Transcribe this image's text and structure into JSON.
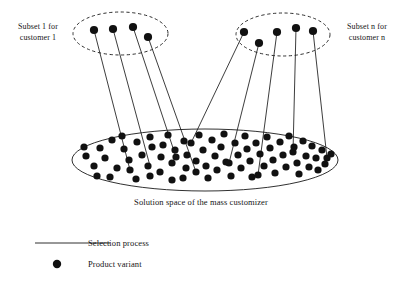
{
  "figure": {
    "title_not_shown": "",
    "labels": {
      "subset_1": "Subset 1 for\ncustomer 1",
      "subset_1_line1": "Subset 1 for",
      "subset_1_line2": "customer 1",
      "subset_n_line1": "Subset n for",
      "subset_n_line2": "customer n",
      "solution_space_caption": "Solution space of the mass customizer"
    },
    "legend": {
      "line_item_label": "Selection process",
      "dot_item_label": "Product variant"
    },
    "colors": {
      "stroke": "#1a1a1a",
      "dot_fill": "#111111",
      "background": "#ffffff"
    }
  },
  "chart_data": {
    "type": "diagram",
    "shapes": {
      "subset_left_ellipse": {
        "cx": 120.5,
        "cy": 33.5,
        "rx": 47.5,
        "ry": 21.5,
        "dashed": true
      },
      "subset_right_ellipse": {
        "cx": 283.0,
        "cy": 34.5,
        "rx": 47.0,
        "ry": 21.5,
        "dashed": true
      },
      "solution_space_ellipse": {
        "cx": 205.0,
        "cy": 160.0,
        "rx": 133.0,
        "ry": 31.0,
        "dashed": false
      }
    },
    "subset_left_dots": [
      {
        "x": 94,
        "y": 30
      },
      {
        "x": 113,
        "y": 29
      },
      {
        "x": 133,
        "y": 27
      },
      {
        "x": 148,
        "y": 37
      }
    ],
    "subset_right_dots": [
      {
        "x": 244,
        "y": 32
      },
      {
        "x": 259,
        "y": 43
      },
      {
        "x": 277,
        "y": 32
      },
      {
        "x": 296,
        "y": 28
      },
      {
        "x": 313,
        "y": 31
      }
    ],
    "selection_lines": [
      {
        "x1": 94,
        "y1": 30,
        "x2": 130,
        "y2": 170
      },
      {
        "x1": 113,
        "y1": 29,
        "x2": 150,
        "y2": 166
      },
      {
        "x1": 133,
        "y1": 27,
        "x2": 176,
        "y2": 157
      },
      {
        "x1": 148,
        "y1": 37,
        "x2": 196,
        "y2": 172
      },
      {
        "x1": 244,
        "y1": 32,
        "x2": 191,
        "y2": 143
      },
      {
        "x1": 259,
        "y1": 43,
        "x2": 229,
        "y2": 163
      },
      {
        "x1": 277,
        "y1": 32,
        "x2": 258,
        "y2": 175
      },
      {
        "x1": 296,
        "y1": 28,
        "x2": 293,
        "y2": 152
      },
      {
        "x1": 313,
        "y1": 31,
        "x2": 327,
        "y2": 158
      }
    ],
    "solution_space_dots": [
      {
        "x": 86,
        "y": 156
      },
      {
        "x": 94,
        "y": 166
      },
      {
        "x": 84,
        "y": 147
      },
      {
        "x": 100,
        "y": 148
      },
      {
        "x": 105,
        "y": 158
      },
      {
        "x": 97,
        "y": 176
      },
      {
        "x": 112,
        "y": 140
      },
      {
        "x": 117,
        "y": 168
      },
      {
        "x": 110,
        "y": 177
      },
      {
        "x": 124,
        "y": 149
      },
      {
        "x": 129,
        "y": 160
      },
      {
        "x": 122,
        "y": 136
      },
      {
        "x": 130,
        "y": 170
      },
      {
        "x": 137,
        "y": 142
      },
      {
        "x": 142,
        "y": 155
      },
      {
        "x": 136,
        "y": 179
      },
      {
        "x": 148,
        "y": 166
      },
      {
        "x": 150,
        "y": 137
      },
      {
        "x": 152,
        "y": 147
      },
      {
        "x": 150,
        "y": 176
      },
      {
        "x": 161,
        "y": 157
      },
      {
        "x": 163,
        "y": 145
      },
      {
        "x": 160,
        "y": 172
      },
      {
        "x": 168,
        "y": 135
      },
      {
        "x": 172,
        "y": 163
      },
      {
        "x": 175,
        "y": 150
      },
      {
        "x": 172,
        "y": 180
      },
      {
        "x": 176,
        "y": 157
      },
      {
        "x": 184,
        "y": 141
      },
      {
        "x": 186,
        "y": 168
      },
      {
        "x": 187,
        "y": 155
      },
      {
        "x": 183,
        "y": 178
      },
      {
        "x": 191,
        "y": 143
      },
      {
        "x": 196,
        "y": 161
      },
      {
        "x": 196,
        "y": 172
      },
      {
        "x": 199,
        "y": 135
      },
      {
        "x": 203,
        "y": 150
      },
      {
        "x": 206,
        "y": 166
      },
      {
        "x": 208,
        "y": 178
      },
      {
        "x": 212,
        "y": 140
      },
      {
        "x": 215,
        "y": 156
      },
      {
        "x": 217,
        "y": 170
      },
      {
        "x": 221,
        "y": 147
      },
      {
        "x": 224,
        "y": 134
      },
      {
        "x": 226,
        "y": 162
      },
      {
        "x": 229,
        "y": 163
      },
      {
        "x": 231,
        "y": 176
      },
      {
        "x": 235,
        "y": 143
      },
      {
        "x": 238,
        "y": 155
      },
      {
        "x": 241,
        "y": 168
      },
      {
        "x": 245,
        "y": 136
      },
      {
        "x": 247,
        "y": 149
      },
      {
        "x": 250,
        "y": 161
      },
      {
        "x": 252,
        "y": 177
      },
      {
        "x": 256,
        "y": 143
      },
      {
        "x": 258,
        "y": 175
      },
      {
        "x": 260,
        "y": 154
      },
      {
        "x": 264,
        "y": 166
      },
      {
        "x": 267,
        "y": 137
      },
      {
        "x": 270,
        "y": 148
      },
      {
        "x": 273,
        "y": 160
      },
      {
        "x": 275,
        "y": 173
      },
      {
        "x": 280,
        "y": 142
      },
      {
        "x": 283,
        "y": 155
      },
      {
        "x": 286,
        "y": 167
      },
      {
        "x": 289,
        "y": 136
      },
      {
        "x": 293,
        "y": 152
      },
      {
        "x": 294,
        "y": 147
      },
      {
        "x": 297,
        "y": 163
      },
      {
        "x": 299,
        "y": 174
      },
      {
        "x": 303,
        "y": 141
      },
      {
        "x": 306,
        "y": 156
      },
      {
        "x": 309,
        "y": 167
      },
      {
        "x": 312,
        "y": 146
      },
      {
        "x": 316,
        "y": 158
      },
      {
        "x": 318,
        "y": 170
      },
      {
        "x": 322,
        "y": 150
      },
      {
        "x": 327,
        "y": 158
      },
      {
        "x": 325,
        "y": 164
      },
      {
        "x": 331,
        "y": 154
      }
    ],
    "legend_items": [
      {
        "symbol": "line",
        "label": "Selection process"
      },
      {
        "symbol": "dot",
        "label": "Product variant"
      }
    ],
    "legend_geometry": {
      "line_x1": 35,
      "line_x2": 110,
      "line_y": 243,
      "dot_x": 57,
      "dot_y": 264,
      "dot_r": 4.2,
      "label_x": 88
    },
    "dot_radius": 3.6
  }
}
